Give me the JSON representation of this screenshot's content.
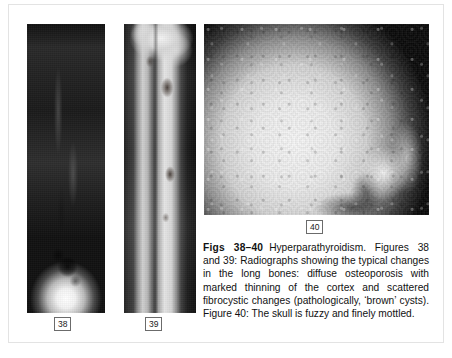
{
  "page": {
    "background_color": "#ffffff",
    "border_color": "#e3e3e3"
  },
  "figures": [
    {
      "id": "38",
      "label": "38",
      "name": "radiograph-long-bone-38",
      "description": "Radiograph of a long bone showing diffuse osteoporosis, marked thinning of the cortex and a fibrocystic 'brown' cyst in the distal metaphysis",
      "orientation": "vertical",
      "background_color": "#000000"
    },
    {
      "id": "39",
      "label": "39",
      "name": "radiograph-long-bone-39",
      "description": "Radiograph of tibia and fibula showing diffuse osteoporosis with scattered fibrocystic 'brown' cysts",
      "orientation": "vertical",
      "background_color": "#101010"
    },
    {
      "id": "40",
      "label": "40",
      "name": "radiograph-skull-40",
      "description": "Lateral skull radiograph that is fuzzy and finely mottled",
      "orientation": "horizontal",
      "background_color": "#070707"
    }
  ],
  "caption": {
    "lead": "Figs 38–40",
    "body": "Hyperparathyroidism. Figures 38 and 39: Radiographs showing the typical changes in the long bones: diffuse osteoporosis with marked thinning of the cortex and scattered fibrocystic changes (pathologically, ‘brown’ cysts). Figure 40: The skull is fuzzy and finely mottled."
  }
}
